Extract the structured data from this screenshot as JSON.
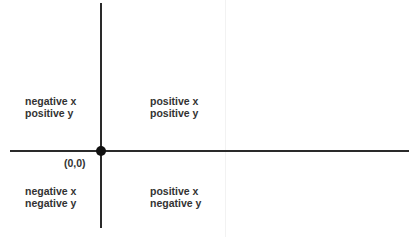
{
  "diagram": {
    "type": "coordinate-plane-quadrants",
    "origin_label": "(0,0)",
    "quadrants": [
      {
        "position": "top-left",
        "line1": "negative x",
        "line2": "positive y"
      },
      {
        "position": "top-right",
        "line1": "positive x",
        "line2": "positive y"
      },
      {
        "position": "bottom-left",
        "line1": "negative x",
        "line2": "negative y"
      },
      {
        "position": "bottom-right",
        "line1": "positive x",
        "line2": "negative y"
      }
    ],
    "colors": {
      "axis": "#2a2a2a",
      "text": "#333333",
      "point": "#111111"
    }
  }
}
